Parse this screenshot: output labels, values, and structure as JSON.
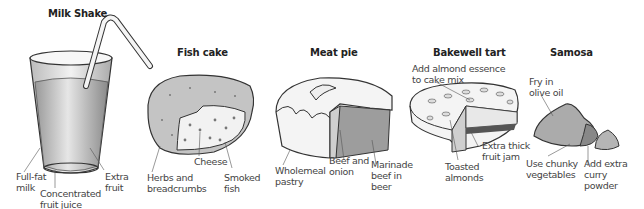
{
  "items": [
    {
      "title": "Milk Shake",
      "labels": [
        "Full-fat\nmilk",
        "Concentrated\nfruit juice",
        "Extra\nfruit"
      ]
    },
    {
      "title": "Fish cake",
      "labels": [
        "Cheese",
        "Herbs and\nbreadcrumbs",
        "Smoked\nfish"
      ]
    },
    {
      "title": "Meat pie",
      "labels": [
        "Wholemeal\npastry",
        "Beef and\nonion",
        "Marinade\nbeef in\nbeer"
      ]
    },
    {
      "title": "Bakewell tart",
      "labels": [
        "Add almond essence\nto cake mix",
        "Extra thick\nfruit jam",
        "Toasted\nalmonds"
      ]
    },
    {
      "title": "Samosa",
      "labels": [
        "Fry in\nolive oil",
        "Use chunky\nvegetables",
        "Add extra\ncurry\npowder"
      ]
    }
  ]
}
